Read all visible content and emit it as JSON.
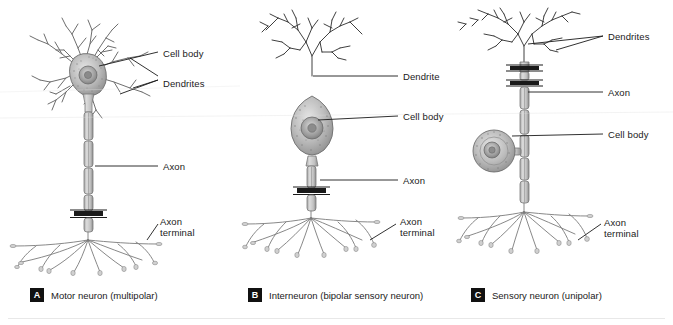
{
  "figure": {
    "title_visible": false,
    "background_color": "#ffffff",
    "line_color": "#1a1a1a",
    "structure_fill": "#b9b9b9",
    "badge_color": "#111111",
    "badge_text_color": "#ffffff"
  },
  "panels": [
    {
      "id": "A",
      "badge": "A",
      "caption": "Motor neuron (multipolar)",
      "badge_x": 30,
      "badge_y": 288,
      "labels": [
        {
          "name": "cell-body",
          "text": "Cell body",
          "x": 163,
          "y": 48
        },
        {
          "name": "dendrites",
          "text": "Dendrites",
          "x": 163,
          "y": 78
        },
        {
          "name": "axon",
          "text": "Axon",
          "x": 163,
          "y": 163
        },
        {
          "name": "axon-terminal",
          "text": "Axon\nterminal",
          "x": 160,
          "y": 218
        }
      ]
    },
    {
      "id": "B",
      "badge": "B",
      "caption": "Interneuron (bipolar sensory neuron)",
      "badge_x": 248,
      "badge_y": 288,
      "labels": [
        {
          "name": "dendrite",
          "text": "Dendrite",
          "x": 403,
          "y": 72
        },
        {
          "name": "cell-body",
          "text": "Cell body",
          "x": 403,
          "y": 112
        },
        {
          "name": "axon",
          "text": "Axon",
          "x": 403,
          "y": 175
        },
        {
          "name": "axon-terminal",
          "text": "Axon\nterminal",
          "x": 400,
          "y": 218
        }
      ]
    },
    {
      "id": "C",
      "badge": "C",
      "caption": "Sensory neuron (unipolar)",
      "badge_x": 471,
      "badge_y": 288,
      "labels": [
        {
          "name": "dendrites",
          "text": "Dendrites",
          "x": 608,
          "y": 33
        },
        {
          "name": "axon",
          "text": "Axon",
          "x": 608,
          "y": 89
        },
        {
          "name": "cell-body",
          "text": "Cell body",
          "x": 608,
          "y": 131
        },
        {
          "name": "axon-terminal",
          "text": "Axon\nterminal",
          "x": 604,
          "y": 219
        }
      ]
    }
  ]
}
